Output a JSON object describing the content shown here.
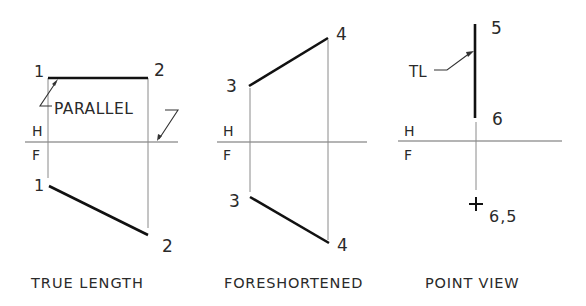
{
  "figure": {
    "colors": {
      "line": "#111111",
      "projector": "#8a8a8a",
      "text": "#2a2a2a",
      "background": "#ffffff"
    },
    "views": [
      {
        "id": "true-length",
        "caption": "TRUE LENGTH",
        "fold_labels": {
          "top": "H",
          "bottom": "F"
        },
        "top_points": {
          "a": "1",
          "b": "2"
        },
        "front_points": {
          "a": "1",
          "b": "2"
        },
        "annotation": "PARALLEL"
      },
      {
        "id": "foreshortened",
        "caption": "FORESHORTENED",
        "fold_labels": {
          "top": "H",
          "bottom": "F"
        },
        "top_points": {
          "a": "3",
          "b": "4"
        },
        "front_points": {
          "a": "3",
          "b": "4"
        }
      },
      {
        "id": "point-view",
        "caption": "POINT VIEW",
        "fold_labels": {
          "top": "H",
          "bottom": "F"
        },
        "top_points": {
          "a": "5",
          "b": "6"
        },
        "front_point": "6,5",
        "annotation": "TL"
      }
    ]
  }
}
